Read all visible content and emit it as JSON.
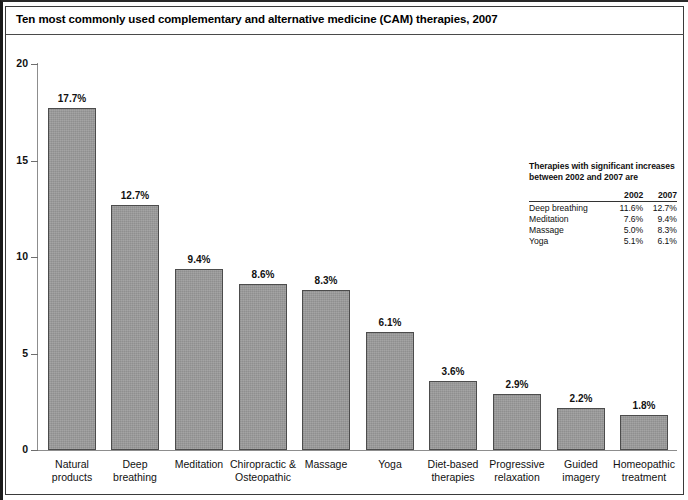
{
  "figure": {
    "title": "Ten most commonly used complementary and alternative medicine (CAM) therapies, 2007"
  },
  "note": {
    "heading_line1": "Therapies with significant increases",
    "heading_line2": "between 2002 and 2007 are",
    "columns": [
      "",
      "2002",
      "2007"
    ],
    "rows": [
      {
        "therapy": "Deep breathing",
        "y2002": "11.6%",
        "y2007": "12.7%"
      },
      {
        "therapy": "Meditation",
        "y2002": "7.6%",
        "y2007": "9.4%"
      },
      {
        "therapy": "Massage",
        "y2002": "5.0%",
        "y2007": "8.3%"
      },
      {
        "therapy": "Yoga",
        "y2002": "5.1%",
        "y2007": "6.1%"
      }
    ]
  },
  "chart_data": {
    "type": "bar",
    "title": "Ten most commonly used complementary and alternative medicine (CAM) therapies, 2007",
    "xlabel": "",
    "ylabel": "",
    "ylim": [
      0,
      20
    ],
    "yticks": [
      "0",
      "5",
      "10",
      "15",
      "20"
    ],
    "grid": false,
    "legend": "none",
    "categories": [
      "Natural products",
      "Deep breathing",
      "Meditation",
      "Chiropractic & Osteopathic",
      "Massage",
      "Yoga",
      "Diet-based therapies",
      "Progressive relaxation",
      "Guided imagery",
      "Homeopathic treatment"
    ],
    "category_lines": [
      [
        "Natural",
        "products"
      ],
      [
        "Deep",
        "breathing"
      ],
      [
        "Meditation",
        ""
      ],
      [
        "Chiropractic &",
        "Osteopathic"
      ],
      [
        "Massage",
        ""
      ],
      [
        "Yoga",
        ""
      ],
      [
        "Diet-based",
        "therapies"
      ],
      [
        "Progressive",
        "relaxation"
      ],
      [
        "Guided",
        "imagery"
      ],
      [
        "Homeopathic",
        "treatment"
      ]
    ],
    "values": [
      17.7,
      12.7,
      9.4,
      8.6,
      8.3,
      6.1,
      3.6,
      2.9,
      2.2,
      1.8
    ],
    "value_labels": [
      "17.7%",
      "12.7%",
      "9.4%",
      "8.6%",
      "8.3%",
      "6.1%",
      "3.6%",
      "2.9%",
      "2.2%",
      "1.8%"
    ],
    "bar_color": "#9a9a9a",
    "bar_edge_color": "#4c4c4c"
  }
}
